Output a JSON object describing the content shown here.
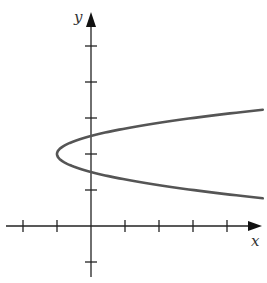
{
  "chart_data": {
    "type": "line",
    "title": "",
    "xlabel": "x",
    "ylabel": "y",
    "equation": "x = 4(y - 2)^2 - 1",
    "curve": "horizontal parabola opening right",
    "vertex": [
      -1,
      2
    ],
    "y_intercepts": [
      1.5,
      2.5
    ],
    "xlim": [
      -2.5,
      5.2
    ],
    "ylim": [
      -1.2,
      5.3
    ],
    "x_ticks": [
      -2,
      -1,
      1,
      2,
      3,
      4
    ],
    "y_ticks": [
      -1,
      1,
      2,
      3,
      4,
      5
    ],
    "tick_labels_shown": false,
    "grid": false,
    "legend": null,
    "series": [
      {
        "name": "parabola",
        "x": [
          5.1,
          3,
          1.25,
          0,
          -0.75,
          -1,
          -0.75,
          0,
          1.25,
          3,
          5.1
        ],
        "y": [
          3.23,
          3.0,
          2.75,
          2.5,
          2.25,
          2.0,
          1.75,
          1.5,
          1.25,
          1.0,
          0.77
        ]
      }
    ],
    "colors": {
      "axis": "#222222",
      "curve": "#555555",
      "background": "#ffffff"
    }
  },
  "labels": {
    "x_axis": "x",
    "y_axis": "y"
  }
}
